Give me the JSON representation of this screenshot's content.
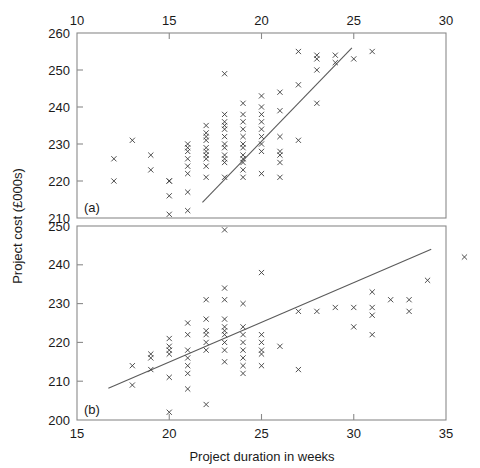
{
  "figure": {
    "ylabel": "Project cost (£000s)",
    "xlabel": "Project duration in weeks",
    "marker_symbol": "x",
    "line_color": "#5a5a5a",
    "marker_color": "#3b3b3b",
    "frame_color": "#8a8a8a"
  },
  "chart_data": [
    {
      "type": "scatter",
      "panel": "(a)",
      "title": "",
      "xlabel": "",
      "ylabel": "Project cost (£000s)",
      "xlim": [
        10,
        30
      ],
      "ylim": [
        210,
        260
      ],
      "xticks": [
        10,
        15,
        20,
        25,
        30
      ],
      "yticks": [
        210,
        220,
        230,
        240,
        250,
        260
      ],
      "xaxis_position": "top",
      "grid": false,
      "legend": "none",
      "trendline": {
        "x": [
          16.8,
          24.9
        ],
        "y": [
          214.2,
          256.0
        ]
      },
      "x": [
        12,
        12,
        13,
        14,
        14,
        15,
        15,
        15,
        15,
        16,
        16,
        16,
        16,
        16,
        16,
        16,
        16,
        17,
        17,
        17,
        17,
        17,
        17,
        17,
        17,
        17,
        17,
        18,
        18,
        18,
        18,
        18,
        18,
        18,
        18,
        18,
        18,
        18,
        18,
        19,
        19,
        19,
        19,
        19,
        19,
        19,
        19,
        19,
        19,
        19,
        19,
        20,
        20,
        20,
        20,
        20,
        20,
        20,
        20,
        20,
        21,
        21,
        21,
        21,
        21,
        21,
        21,
        22,
        22,
        22,
        23,
        23,
        23,
        23,
        24,
        24,
        25,
        26
      ],
      "y": [
        226,
        220,
        231,
        227,
        223,
        220,
        220,
        216,
        211,
        230,
        229,
        228,
        226,
        224,
        222,
        217,
        212,
        235,
        233,
        232,
        231,
        229,
        228,
        227,
        226,
        224,
        221,
        249,
        238,
        236,
        235,
        234,
        232,
        230,
        229,
        227,
        221,
        226,
        225,
        241,
        238,
        236,
        234,
        232,
        230,
        229,
        227,
        225,
        223,
        221,
        226,
        243,
        240,
        238,
        236,
        234,
        232,
        230,
        228,
        222,
        244,
        239,
        232,
        228,
        227,
        225,
        221,
        255,
        246,
        231,
        254,
        253,
        250,
        241,
        254,
        252,
        253,
        255
      ]
    },
    {
      "type": "scatter",
      "panel": "(b)",
      "title": "",
      "xlabel": "Project duration in weeks",
      "ylabel": "Project cost (£000s)",
      "xlim": [
        15,
        35
      ],
      "ylim": [
        200,
        250
      ],
      "xticks": [
        15,
        20,
        25,
        30,
        35
      ],
      "yticks": [
        200,
        210,
        220,
        230,
        240,
        250
      ],
      "xaxis_position": "bottom",
      "grid": false,
      "legend": "none",
      "trendline": {
        "x": [
          16.7,
          34.2
        ],
        "y": [
          208.2,
          244.0
        ]
      },
      "x": [
        18,
        18,
        19,
        19,
        19,
        20,
        20,
        20,
        20,
        20,
        20,
        21,
        21,
        21,
        21,
        21,
        21,
        21,
        22,
        22,
        22,
        22,
        22,
        22,
        22,
        23,
        23,
        23,
        23,
        23,
        23,
        23,
        23,
        23,
        23,
        24,
        24,
        24,
        24,
        24,
        24,
        24,
        24,
        25,
        25,
        25,
        25,
        25,
        25,
        26,
        27,
        27,
        28,
        29,
        30,
        30,
        31,
        31,
        31,
        31,
        32,
        33,
        33,
        34,
        36
      ],
      "y": [
        214,
        209,
        217,
        216,
        213,
        221,
        219,
        218,
        217,
        211,
        202,
        225,
        222,
        218,
        216,
        214,
        212,
        208,
        231,
        226,
        223,
        222,
        220,
        218,
        204,
        249,
        234,
        231,
        226,
        224,
        223,
        222,
        220,
        218,
        215,
        230,
        224,
        222,
        220,
        218,
        216,
        214,
        212,
        238,
        222,
        220,
        218,
        217,
        214,
        219,
        228,
        213,
        228,
        229,
        229,
        224,
        233,
        229,
        227,
        222,
        231,
        231,
        228,
        236,
        242
      ]
    }
  ]
}
